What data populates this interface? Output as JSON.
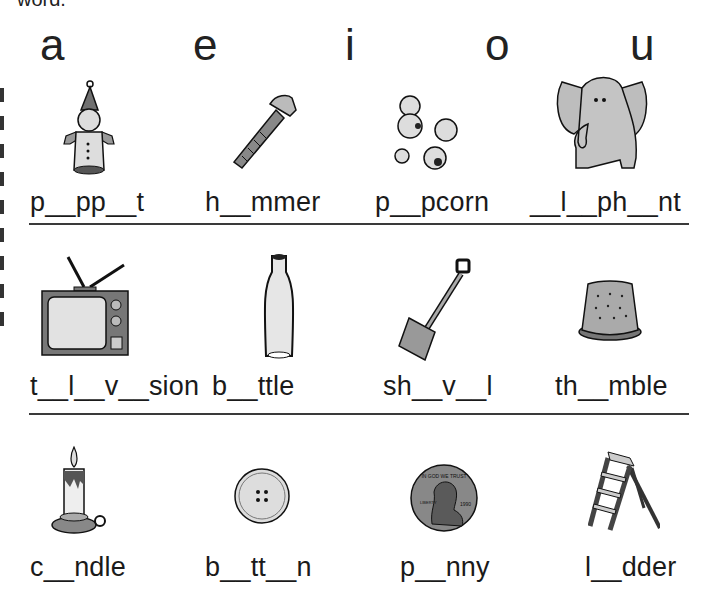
{
  "header": {
    "clipped_text": "word.",
    "vowels": [
      "a",
      "e",
      "i",
      "o",
      "u"
    ]
  },
  "rows": [
    {
      "items": [
        {
          "picture": "puppet",
          "word": "p__pp__t"
        },
        {
          "picture": "hammer",
          "word": "h__mmer"
        },
        {
          "picture": "popcorn",
          "word": "p__pcorn"
        },
        {
          "picture": "elephant",
          "word": "__l__ph__nt"
        }
      ]
    },
    {
      "items": [
        {
          "picture": "television",
          "word": "t__l__v__sion"
        },
        {
          "picture": "bottle",
          "word": "b__ttle"
        },
        {
          "picture": "shovel",
          "word": "sh__v__l"
        },
        {
          "picture": "thimble",
          "word": "th__mble"
        }
      ]
    },
    {
      "items": [
        {
          "picture": "candle",
          "word": "c__ndle"
        },
        {
          "picture": "button",
          "word": "b__tt__n"
        },
        {
          "picture": "penny",
          "word": "p__nny"
        },
        {
          "picture": "ladder",
          "word": "l__dder"
        }
      ]
    }
  ],
  "penny_text": {
    "motto": "IN GOD WE TRUST",
    "liberty": "LIBERTY",
    "year": "1990"
  },
  "colors": {
    "ink": "#111111",
    "gray_fill": "#b9b9b9",
    "dark_fill": "#707070",
    "divider": "#3a3a3a"
  }
}
